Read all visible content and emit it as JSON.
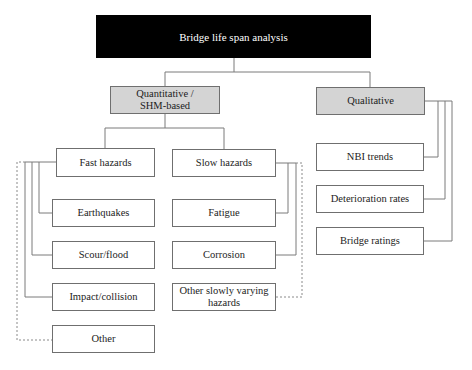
{
  "diagram": {
    "root": {
      "label": "Bridge life span analysis",
      "fill": "#000000",
      "text_color": "#ffffff"
    },
    "categories": [
      {
        "id": "quant",
        "label_line1": "Quantitative /",
        "label_line2": "SHM-based",
        "fill": "#d4d4d4"
      },
      {
        "id": "qual",
        "label": "Qualitative",
        "fill": "#d4d4d4"
      }
    ],
    "hazard_groups": [
      {
        "id": "fast",
        "label": "Fast hazards",
        "children": [
          "Earthquakes",
          "Scour/flood",
          "Impact/collision",
          "Other"
        ]
      },
      {
        "id": "slow",
        "label": "Slow hazards",
        "children": [
          "Fatigue",
          "Corrosion",
          "Other slowly varying hazards"
        ]
      }
    ],
    "slow_other_line1": "Other slowly varying",
    "slow_other_line2": "hazards",
    "qualitative_children": [
      "NBI trends",
      "Deterioration rates",
      "Bridge ratings"
    ],
    "colors": {
      "border": "#6f6f6f",
      "connector": "#7a7a7a",
      "category_fill": "#d4d4d4"
    },
    "dashed_links": [
      "Fast hazards -> Other",
      "Slow hazards -> Other slowly varying hazards"
    ]
  }
}
